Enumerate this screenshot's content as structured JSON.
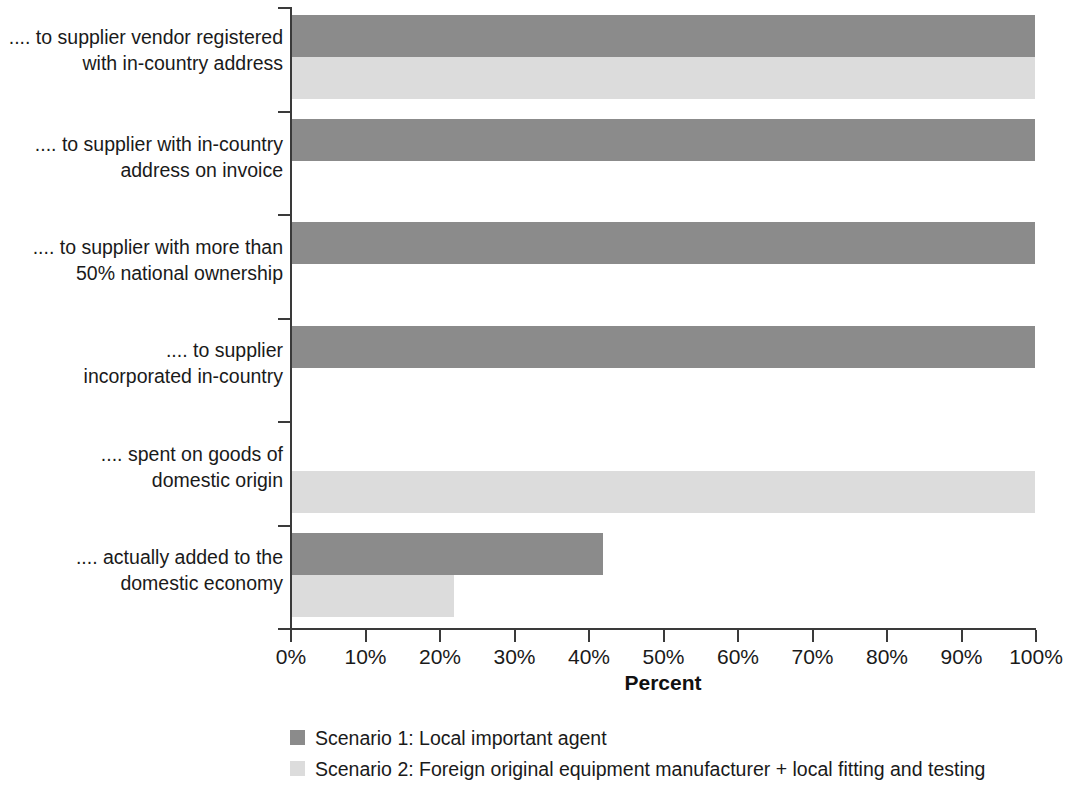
{
  "chart_data": {
    "type": "bar",
    "orientation": "horizontal",
    "grouped": true,
    "title": "",
    "xlabel": "Percent",
    "ylabel": "",
    "xlim": [
      0,
      100
    ],
    "xticks": [
      "0%",
      "10%",
      "20%",
      "30%",
      "40%",
      "50%",
      "60%",
      "70%",
      "80%",
      "90%",
      "100%"
    ],
    "xtick_values": [
      0,
      10,
      20,
      30,
      40,
      50,
      60,
      70,
      80,
      90,
      100
    ],
    "grid": false,
    "legend_position": "bottom",
    "categories": [
      ".... to supplier vendor registered with in-country address",
      ".... to supplier with in-country address on invoice",
      ".... to supplier with more than 50% national ownership",
      ".... to supplier incorporated in-country",
      ".... spent on goods of domestic origin",
      ".... actually added to the domestic economy"
    ],
    "category_lines": [
      [
        ".... to supplier vendor registered",
        "with in-country address"
      ],
      [
        ".... to supplier with in-country",
        "address on invoice"
      ],
      [
        ".... to supplier with more than",
        "50% national ownership"
      ],
      [
        ".... to supplier",
        "incorporated in-country"
      ],
      [
        ".... spent on goods of",
        "domestic origin"
      ],
      [
        ".... actually added to the",
        "domestic economy"
      ]
    ],
    "series": [
      {
        "name": "Scenario 1: Local important agent",
        "color": "#8b8b8b",
        "values": [
          100,
          100,
          100,
          100,
          0,
          42
        ]
      },
      {
        "name": "Scenario 2: Foreign original equipment manufacturer + local fitting and testing",
        "color": "#dcdcdc",
        "values": [
          100,
          0,
          0,
          0,
          100,
          22
        ]
      }
    ]
  },
  "legend": {
    "items": [
      {
        "label": "Scenario 1: Local important agent",
        "color": "#8b8b8b"
      },
      {
        "label": "Scenario 2: Foreign original equipment manufacturer + local fitting and testing",
        "color": "#dcdcdc"
      }
    ]
  },
  "axis": {
    "x_title": "Percent"
  }
}
